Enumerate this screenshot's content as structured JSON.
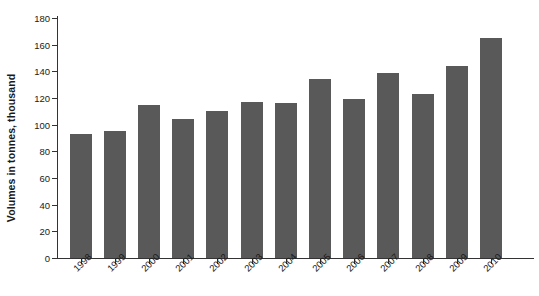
{
  "chart_data": {
    "type": "bar",
    "title": "",
    "xlabel": "",
    "ylabel": "Volumes in tonnes, thousand",
    "categories": [
      "1998",
      "1999",
      "2000",
      "2001",
      "2002",
      "2003",
      "2004",
      "2005",
      "2006",
      "2007",
      "2008",
      "2009",
      "2010"
    ],
    "values": [
      93,
      95,
      115,
      104,
      110,
      117,
      116,
      134,
      119,
      139,
      123,
      144,
      165
    ],
    "ylim": [
      0,
      180
    ],
    "ytick_labels": [
      "0",
      "20",
      "40",
      "60",
      "80",
      "100",
      "120",
      "140",
      "160",
      "180"
    ],
    "ytick_values": [
      0,
      20,
      40,
      60,
      80,
      100,
      120,
      140,
      160,
      180
    ],
    "grid": false,
    "legend": false,
    "legend_position": "none",
    "series": [
      {
        "name": "Volumes",
        "color": "#595959",
        "values": [
          93,
          95,
          115,
          104,
          110,
          117,
          116,
          134,
          119,
          139,
          123,
          144,
          165
        ]
      }
    ]
  },
  "colors": {
    "bar": "#595959",
    "axis": "#333333",
    "background": "#ffffff",
    "text": "#1a1a1a"
  }
}
